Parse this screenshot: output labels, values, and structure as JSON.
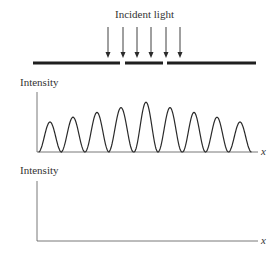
{
  "figure": {
    "incident_label": "Incident light",
    "top_panel": {
      "ylabel": "Intensity",
      "xlabel": "x"
    },
    "bottom_panel": {
      "ylabel": "Intensity",
      "xlabel": "x"
    },
    "colors": {
      "ink": "#2a2a2a",
      "background": "#ffffff"
    }
  },
  "chart_data": [
    {
      "type": "line",
      "title": "",
      "xlabel": "x",
      "ylabel": "Intensity",
      "description": "Multi-slit interference pattern: 9 fringes with symmetric envelope, brightest at center",
      "peaks_x_px": [
        50,
        73,
        97,
        121,
        146,
        170,
        194,
        217,
        240
      ],
      "peak_relative_intensity": [
        0.5,
        0.58,
        0.66,
        0.74,
        0.83,
        0.74,
        0.66,
        0.58,
        0.5
      ],
      "grid": false
    },
    {
      "type": "line",
      "title": "",
      "xlabel": "x",
      "ylabel": "Intensity",
      "description": "Empty axes (to be filled in)",
      "grid": false
    }
  ]
}
